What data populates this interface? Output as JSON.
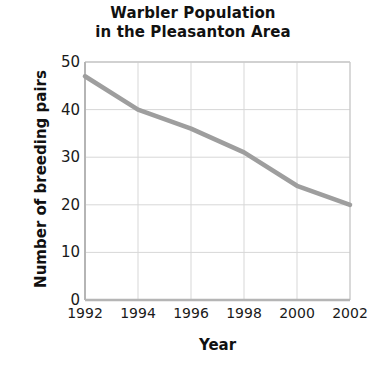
{
  "chart_data": {
    "type": "line",
    "title": "Warbler Population\nin the Pleasanton Area",
    "title_line1": "Warbler Population",
    "title_line2": "in the Pleasanton Area",
    "xlabel": "Year",
    "ylabel": "Number of breeding pairs",
    "x": [
      1992,
      1994,
      1996,
      1998,
      2000,
      2002
    ],
    "values": [
      47,
      40,
      36,
      31,
      24,
      20
    ],
    "series": [
      {
        "name": "Number of breeding pairs",
        "values": [
          47,
          40,
          36,
          31,
          24,
          20
        ],
        "color": "#9e9e9e"
      }
    ],
    "xtick_labels": [
      "1992",
      "1994",
      "1996",
      "1998",
      "2000",
      "2002"
    ],
    "ytick_labels": [
      "0",
      "10",
      "20",
      "30",
      "40",
      "50"
    ],
    "yticks": [
      0,
      10,
      20,
      30,
      40,
      50
    ],
    "xlim": [
      1992,
      2002
    ],
    "ylim": [
      0,
      50
    ],
    "grid": true,
    "legend": "none",
    "line_color": "#9e9e9e",
    "grid_color": "#d7d7d7",
    "axis_color": "#bdbdbd",
    "background": "#ffffff"
  }
}
